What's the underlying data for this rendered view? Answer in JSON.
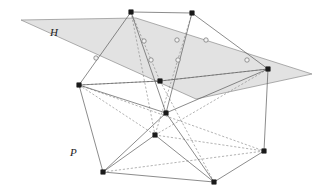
{
  "figure": {
    "width": 332,
    "height": 193,
    "background": "#ffffff",
    "labels": [
      {
        "name": "hyperplane-label",
        "text": "H",
        "x": 50,
        "y": 36
      },
      {
        "name": "polytope-label",
        "text": "P",
        "x": 70,
        "y": 156
      }
    ],
    "colors": {
      "plane_fill": "#dcdcdc",
      "plane_stroke": "#8c8c8c",
      "solid_edge": "#5a5a5a",
      "dark_edge": "#3a3a3a",
      "dashed_edge": "#8a8a8a",
      "vertex_filled": "#1a1a1a",
      "vertex_hollow_fill": "#f2f2f2",
      "vertex_hollow_stroke": "#6f6f6f"
    }
  },
  "chart_data": {
    "type": "diagram",
    "xlabel": "",
    "ylabel": "",
    "xlim": [
      0,
      332
    ],
    "ylim": [
      0,
      193
    ],
    "grid": false,
    "legend": null,
    "annotations": [
      {
        "label": "H",
        "x": 50,
        "y": 36,
        "role": "hyperplane"
      },
      {
        "label": "P",
        "x": 70,
        "y": 156,
        "role": "polytope"
      }
    ],
    "plane_polygon": {
      "name": "hyperplane-H",
      "points": [
        [
          21,
          20
        ],
        [
          136,
          18
        ],
        [
          312,
          74
        ],
        [
          196,
          99
        ]
      ]
    },
    "vertices_filled": [
      {
        "id": "t1",
        "x": 131,
        "y": 12
      },
      {
        "id": "t2",
        "x": 192,
        "y": 13
      },
      {
        "id": "l1",
        "x": 79,
        "y": 85
      },
      {
        "id": "r1",
        "x": 268,
        "y": 69
      },
      {
        "id": "m1",
        "x": 160,
        "y": 81
      },
      {
        "id": "c1",
        "x": 166,
        "y": 113
      },
      {
        "id": "c2",
        "x": 155,
        "y": 135
      },
      {
        "id": "b1",
        "x": 103,
        "y": 172
      },
      {
        "id": "b2",
        "x": 214,
        "y": 182
      },
      {
        "id": "b3",
        "x": 264,
        "y": 151
      }
    ],
    "vertices_hollow": [
      {
        "id": "h1",
        "x": 96,
        "y": 58
      },
      {
        "id": "h2",
        "x": 144,
        "y": 41
      },
      {
        "id": "h3",
        "x": 151,
        "y": 60
      },
      {
        "id": "h4",
        "x": 177,
        "y": 40
      },
      {
        "id": "h5",
        "x": 178,
        "y": 60
      },
      {
        "id": "h6",
        "x": 206,
        "y": 40
      },
      {
        "id": "h7",
        "x": 247,
        "y": 60
      }
    ],
    "edges_solid": [
      [
        [
          131,
          12
        ],
        [
          192,
          13
        ]
      ],
      [
        [
          131,
          12
        ],
        [
          79,
          85
        ]
      ],
      [
        [
          192,
          13
        ],
        [
          268,
          69
        ]
      ],
      [
        [
          131,
          12
        ],
        [
          166,
          113
        ]
      ],
      [
        [
          192,
          13
        ],
        [
          166,
          113
        ]
      ],
      [
        [
          79,
          85
        ],
        [
          160,
          81
        ]
      ],
      [
        [
          160,
          81
        ],
        [
          268,
          69
        ]
      ],
      [
        [
          79,
          85
        ],
        [
          166,
          113
        ]
      ],
      [
        [
          166,
          113
        ],
        [
          268,
          69
        ]
      ],
      [
        [
          79,
          85
        ],
        [
          103,
          172
        ]
      ],
      [
        [
          268,
          69
        ],
        [
          264,
          151
        ]
      ],
      [
        [
          103,
          172
        ],
        [
          214,
          182
        ]
      ],
      [
        [
          214,
          182
        ],
        [
          264,
          151
        ]
      ],
      [
        [
          166,
          113
        ],
        [
          103,
          172
        ]
      ],
      [
        [
          166,
          113
        ],
        [
          214,
          182
        ]
      ],
      [
        [
          155,
          135
        ],
        [
          103,
          172
        ]
      ],
      [
        [
          155,
          135
        ],
        [
          214,
          182
        ]
      ]
    ],
    "edges_dashed": [
      [
        [
          131,
          12
        ],
        [
          155,
          135
        ]
      ],
      [
        [
          192,
          13
        ],
        [
          155,
          135
        ]
      ],
      [
        [
          79,
          85
        ],
        [
          160,
          81
        ]
      ],
      [
        [
          160,
          81
        ],
        [
          268,
          69
        ]
      ],
      [
        [
          155,
          135
        ],
        [
          264,
          151
        ]
      ],
      [
        [
          155,
          135
        ],
        [
          268,
          69
        ]
      ],
      [
        [
          79,
          85
        ],
        [
          155,
          135
        ]
      ],
      [
        [
          103,
          172
        ],
        [
          264,
          151
        ]
      ],
      [
        [
          79,
          85
        ],
        [
          264,
          151
        ]
      ],
      [
        [
          160,
          81
        ],
        [
          214,
          182
        ]
      ],
      [
        [
          131,
          12
        ],
        [
          160,
          81
        ]
      ]
    ]
  }
}
